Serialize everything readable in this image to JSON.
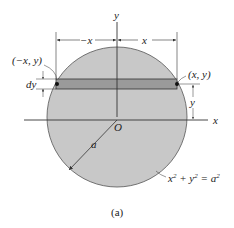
{
  "figure": {
    "caption": "(a)",
    "labels": {
      "y_axis": "y",
      "x_axis": "x",
      "origin": "O",
      "neg_x": "−x",
      "pos_x": "x",
      "left_point": "(−x, y)",
      "right_point": "(x, y)",
      "dy": "dy",
      "y_height": "y",
      "radius": "a",
      "equation_base": "x",
      "equation_mid": " + y",
      "equation_eq": " = a",
      "sup": "2"
    },
    "colors": {
      "disk_fill": "#c8c8c8",
      "strip_fill": "#9a9a9a",
      "stroke": "#333333"
    }
  }
}
